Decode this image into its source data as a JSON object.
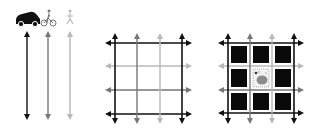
{
  "colors": {
    "dark": "#111111",
    "mid": "#777777",
    "light": "#b8b8b8",
    "block": "#0a0a0a",
    "park": "#8c8c8c",
    "background": "#ffffff"
  },
  "legend": {
    "modes": [
      {
        "name": "car",
        "icon": "car-icon",
        "shade": "dark"
      },
      {
        "name": "bicycle",
        "icon": "bicycle-icon",
        "shade": "mid"
      },
      {
        "name": "pedestrian",
        "icon": "pedestrian-icon",
        "shade": "light"
      }
    ]
  },
  "panels": [
    {
      "id": "mode-lines",
      "description": "Three bidirectional street lines, one per travel mode"
    },
    {
      "id": "street-grid",
      "description": "3x3 street grid with mode-specific line shades"
    },
    {
      "id": "grid-with-blocks",
      "description": "Street grid with 8 building blocks and central park cell"
    }
  ]
}
